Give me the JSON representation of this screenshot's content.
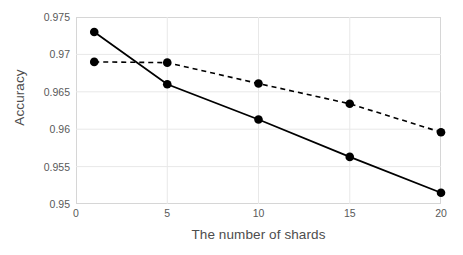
{
  "chart_data": {
    "type": "line",
    "title": "",
    "xlabel": "The number of shards",
    "ylabel": "Accuracy",
    "x": [
      1,
      5,
      10,
      15,
      20
    ],
    "xlim": [
      0,
      20
    ],
    "ylim": [
      0.95,
      0.975
    ],
    "xticks": [
      "0",
      "5",
      "10",
      "15",
      "20"
    ],
    "xtick_values": [
      0,
      5,
      10,
      15,
      20
    ],
    "yticks": [
      "0.95",
      "0.955",
      "0.96",
      "0.965",
      "0.97",
      "0.975"
    ],
    "ytick_values": [
      0.95,
      0.955,
      0.96,
      0.965,
      0.97,
      0.975
    ],
    "grid": true,
    "legend": "none",
    "series": [
      {
        "name": "solid-series",
        "style": "solid",
        "marker": "circle",
        "color": "#000000",
        "values": [
          0.973,
          0.966,
          0.9613,
          0.9563,
          0.9515
        ]
      },
      {
        "name": "dashed-series",
        "style": "dashed",
        "marker": "circle",
        "color": "#000000",
        "values": [
          0.969,
          0.9689,
          0.9661,
          0.9634,
          0.9596
        ]
      }
    ]
  },
  "colors": {
    "gridline": "#e8e8e8",
    "frame": "#d6d6d6",
    "tick_text": "#595959",
    "axis_title": "#4d4d4d",
    "data": "#000000"
  }
}
